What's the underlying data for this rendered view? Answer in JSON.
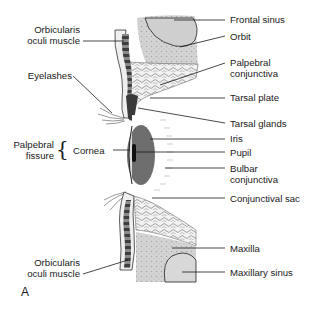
{
  "diagram": {
    "panel_label": "A",
    "labels_left": [
      {
        "id": "orbicularis-upper",
        "line1": "Orbicularis",
        "line2": "oculi muscle"
      },
      {
        "id": "eyelashes",
        "line1": "Eyelashes"
      },
      {
        "id": "palpebral-fissure",
        "line1": "Palpebral",
        "line2": "fissure"
      },
      {
        "id": "cornea",
        "line1": "Cornea"
      },
      {
        "id": "orbicularis-lower",
        "line1": "Orbicularis",
        "line2": "oculi muscle"
      }
    ],
    "labels_right": [
      {
        "id": "frontal-sinus",
        "line1": "Frontal sinus"
      },
      {
        "id": "orbit",
        "line1": "Orbit"
      },
      {
        "id": "palpebral-conjunctiva",
        "line1": "Palpebral",
        "line2": "conjunctiva"
      },
      {
        "id": "tarsal-plate",
        "line1": "Tarsal plate"
      },
      {
        "id": "tarsal-glands",
        "line1": "Tarsal glands"
      },
      {
        "id": "iris",
        "line1": "Iris"
      },
      {
        "id": "pupil",
        "line1": "Pupil"
      },
      {
        "id": "bulbar-conjunctiva",
        "line1": "Bulbar",
        "line2": "conjunctiva"
      },
      {
        "id": "conjunctival-sac",
        "line1": "Conjunctival sac"
      },
      {
        "id": "maxilla",
        "line1": "Maxilla"
      },
      {
        "id": "maxillary-sinus",
        "line1": "Maxillary sinus"
      }
    ],
    "colors": {
      "bone": "#c8c8c8",
      "sinus": "#d6d6d6",
      "tissue": "#e4e4e4",
      "muscle": "#4a4a4a",
      "iris": "#6e6e6e",
      "pupil": "#111111",
      "line": "#1a1a1a"
    }
  }
}
